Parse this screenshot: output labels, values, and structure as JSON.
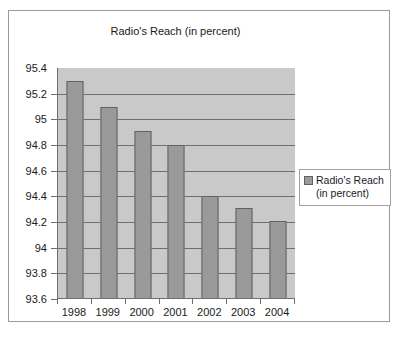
{
  "chart_data": {
    "type": "bar",
    "title": "Radio's Reach (in percent)",
    "xlabel": "",
    "ylabel": "",
    "categories": [
      "1998",
      "1999",
      "2000",
      "2001",
      "2002",
      "2003",
      "2004"
    ],
    "values": [
      95.3,
      95.1,
      94.91,
      94.8,
      94.4,
      94.31,
      94.21
    ],
    "series": [
      {
        "name": "Radio's Reach (in percent)",
        "values": [
          95.3,
          95.1,
          94.91,
          94.8,
          94.4,
          94.31,
          94.21
        ]
      }
    ],
    "ylim": [
      93.6,
      95.4
    ],
    "ytick_labels": [
      "95.4",
      "95.2",
      "95",
      "94.8",
      "94.6",
      "94.4",
      "94.2",
      "94",
      "93.8",
      "93.6"
    ],
    "ytick_values": [
      95.4,
      95.2,
      95.0,
      94.8,
      94.6,
      94.4,
      94.2,
      94.0,
      93.8,
      93.6
    ],
    "grid": true,
    "legend_position": "right",
    "legend_entries": [
      "Radio's Reach (in percent)"
    ],
    "colors": {
      "bar_fill": "#9a9a9a",
      "bar_border": "#626262",
      "plot_background": "#c9c9c9",
      "gridline": "#6f6f6f",
      "frame_border": "#9a9a9a",
      "text": "#1a1a1a"
    }
  },
  "legend": {
    "label": "Radio's Reach (in percent)",
    "swatch_name": "series-color-swatch"
  }
}
